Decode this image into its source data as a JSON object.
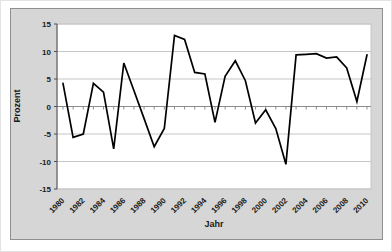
{
  "chart_data": {
    "type": "line",
    "title": "",
    "xlabel": "Jahr",
    "ylabel": "Prozent",
    "x": [
      1980,
      1981,
      1982,
      1983,
      1984,
      1985,
      1986,
      1987,
      1988,
      1989,
      1990,
      1991,
      1992,
      1993,
      1994,
      1995,
      1996,
      1997,
      1998,
      1999,
      2000,
      2001,
      2002,
      2003,
      2004,
      2005,
      2006,
      2007,
      2008,
      2009,
      2010
    ],
    "values": [
      4.2,
      -5.6,
      -5.0,
      4.2,
      2.6,
      -7.7,
      7.9,
      2.9,
      -2.2,
      -7.3,
      -4.0,
      12.9,
      12.2,
      6.2,
      5.9,
      -2.9,
      5.5,
      8.3,
      4.7,
      -3.0,
      -0.6,
      -4.0,
      -10.5,
      9.4,
      9.5,
      9.6,
      8.8,
      9.0,
      7.0,
      0.9,
      9.4
    ],
    "ylim": [
      -15,
      15
    ],
    "ytick_step": 5,
    "yticks": [
      "15",
      "10",
      "5",
      "0",
      "-5",
      "-10",
      "-15"
    ],
    "xtick_step": 2,
    "xticks": [
      "1980",
      "1982",
      "1984",
      "1986",
      "1988",
      "1990",
      "1992",
      "1994",
      "1996",
      "1998",
      "2000",
      "2002",
      "2004",
      "2006",
      "2008",
      "2010"
    ],
    "grid": true,
    "legend": "none",
    "colors": {
      "series_line": "#000000",
      "plot_bg": "#ffffff",
      "chart_bg": "#d6d6d6",
      "gridline": "#c6c6c6",
      "y_axis": "#4d4d4d",
      "zero_axis": "#8c8c8c",
      "tick_text": "#1a1a1a"
    }
  }
}
